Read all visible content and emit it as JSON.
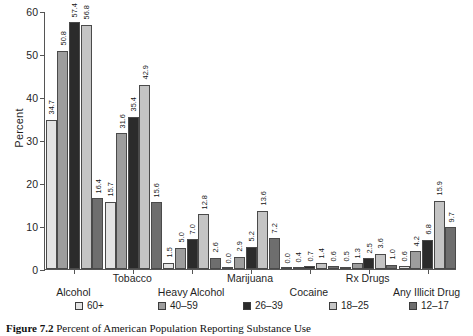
{
  "chart_data": {
    "type": "bar",
    "title": "",
    "xlabel": "",
    "ylabel": "Percent",
    "ylim": [
      0,
      60
    ],
    "yticks": [
      0,
      10,
      20,
      30,
      40,
      50,
      60
    ],
    "grid": false,
    "legend_position": "bottom",
    "categories": [
      "Alcohol",
      "Tobacco",
      "Heavy Alcohol",
      "Marijuana",
      "Cocaine",
      "Rx Drugs",
      "Any Illicit Drug"
    ],
    "series": [
      {
        "name": "60+",
        "color": "#e3e3e3",
        "values": [
          34.7,
          15.7,
          1.5,
          0.0,
          0.0,
          0.5,
          0.6
        ]
      },
      {
        "name": "40–59",
        "color": "#9d9d9d",
        "values": [
          50.8,
          31.6,
          5.0,
          2.9,
          0.4,
          1.3,
          4.2
        ]
      },
      {
        "name": "26–39",
        "color": "#2b2b2b",
        "values": [
          57.4,
          35.4,
          7.0,
          5.2,
          0.7,
          2.5,
          6.8
        ]
      },
      {
        "name": "18–25",
        "color": "#c4c4c4",
        "values": [
          56.8,
          42.9,
          12.8,
          13.6,
          1.4,
          3.6,
          15.9
        ]
      },
      {
        "name": "12–17",
        "color": "#6e6e6e",
        "values": [
          16.4,
          15.6,
          2.6,
          7.2,
          0.6,
          1.0,
          9.7
        ]
      }
    ],
    "bar_labels": [
      [
        "34.7",
        "50.8",
        "57.4",
        "56.8",
        "16.4"
      ],
      [
        "15.7",
        "31.6",
        "35.4",
        "42.9",
        "15.6"
      ],
      [
        "1.5",
        "5.0",
        "7.0",
        "12.8",
        "2.6"
      ],
      [
        "0.0",
        "2.9",
        "5.2",
        "13.6",
        "7.2"
      ],
      [
        "0.0",
        "0.4",
        "0.7",
        "1.4",
        "0.6"
      ],
      [
        "0.5",
        "1.3",
        "2.5",
        "3.6",
        "1.0"
      ],
      [
        "0.6",
        "4.2",
        "6.8",
        "15.9",
        "9.7"
      ]
    ]
  },
  "caption": {
    "number": "Figure 7.2",
    "text": "Percent of American Population Reporting Substance Use"
  }
}
